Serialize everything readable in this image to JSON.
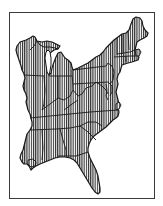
{
  "map": {
    "title": "Eastern United States",
    "style": "vertical-hatch",
    "colors": {
      "background": "#ffffff",
      "frame": "#3a3a3a",
      "outline": "#1a1a1a",
      "hatch": "#2a2a2a",
      "hatch_gap": "#ffffff",
      "water": "#ffffff"
    },
    "regions": [
      {
        "name": "Wisconsin"
      },
      {
        "name": "Michigan"
      },
      {
        "name": "Illinois"
      },
      {
        "name": "Indiana"
      },
      {
        "name": "Ohio"
      },
      {
        "name": "Kentucky"
      },
      {
        "name": "Tennessee"
      },
      {
        "name": "Mississippi"
      },
      {
        "name": "Alabama"
      },
      {
        "name": "Georgia"
      },
      {
        "name": "Florida"
      },
      {
        "name": "South Carolina"
      },
      {
        "name": "North Carolina"
      },
      {
        "name": "Virginia"
      },
      {
        "name": "West Virginia"
      },
      {
        "name": "Maryland"
      },
      {
        "name": "Delaware"
      },
      {
        "name": "Pennsylvania"
      },
      {
        "name": "New Jersey"
      },
      {
        "name": "New York"
      },
      {
        "name": "Connecticut"
      },
      {
        "name": "Rhode Island"
      },
      {
        "name": "Massachusetts"
      },
      {
        "name": "Vermont"
      },
      {
        "name": "New Hampshire"
      },
      {
        "name": "Maine"
      }
    ]
  }
}
